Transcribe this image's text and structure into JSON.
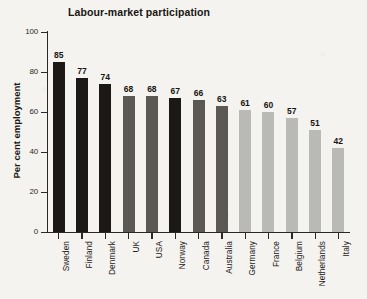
{
  "chart_data": {
    "type": "bar",
    "title": "Labour-market participation",
    "xlabel": "",
    "ylabel": "Per cent employment",
    "ylim": [
      0,
      100
    ],
    "yticks": [
      0,
      20,
      40,
      60,
      80,
      100
    ],
    "grid": false,
    "legend": "none",
    "categories": [
      "Sweden",
      "Finland",
      "Denmark",
      "UK",
      "USA",
      "Norway",
      "Canada",
      "Australia",
      "Germany",
      "France",
      "Belgium",
      "Netherlands",
      "Italy"
    ],
    "values": [
      85,
      77,
      74,
      68,
      68,
      67,
      66,
      63,
      61,
      60,
      57,
      51,
      42
    ],
    "value_labels": [
      "85",
      "77",
      "74",
      "68",
      "68",
      "67",
      "66",
      "63",
      "61",
      "60",
      "57",
      "51",
      "42"
    ],
    "bar_colors": [
      "#1c1815",
      "#1c1815",
      "#1c1815",
      "#5c5955",
      "#5c5955",
      "#1c1815",
      "#5c5955",
      "#5c5955",
      "#b9b9b6",
      "#b9b9b6",
      "#b9b9b6",
      "#b9b9b6",
      "#b9b9b6"
    ],
    "ytick_labels": [
      "0",
      "20",
      "40",
      "60",
      "80",
      "100"
    ]
  },
  "colors": {
    "background": "#f4f3ef",
    "axis": "#2a2724",
    "text": "#181512",
    "bar_dark": "#1c1815",
    "bar_medium": "#5c5955",
    "bar_light": "#b9b9b6"
  }
}
